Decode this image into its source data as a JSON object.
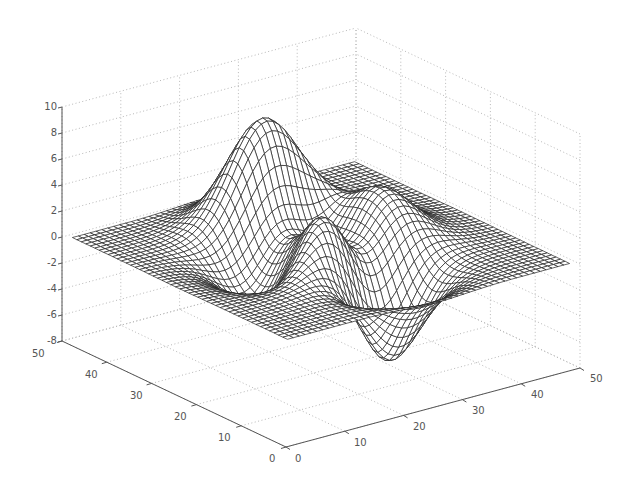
{
  "chart_data": {
    "type": "surface-mesh",
    "title": "",
    "function": "peaks",
    "grid_size": 49,
    "domain": [
      -3,
      3
    ],
    "x": {
      "label": "",
      "range": [
        0,
        50
      ],
      "ticks": [
        0,
        10,
        20,
        30,
        40,
        50
      ]
    },
    "y": {
      "label": "",
      "range": [
        0,
        50
      ],
      "ticks": [
        0,
        10,
        20,
        30,
        40,
        50
      ]
    },
    "z": {
      "label": "",
      "range": [
        -8,
        10
      ],
      "ticks": [
        -8,
        -6,
        -4,
        -2,
        0,
        2,
        4,
        6,
        8,
        10
      ]
    },
    "grid": true,
    "legend": null,
    "features": {
      "max_peak": {
        "z": 8.1,
        "note": "tall peak toward back-left"
      },
      "secondary_peak": {
        "z": 3.8,
        "note": "middle-front peak"
      },
      "trough": {
        "z": -6.55,
        "note": "deep trough front-right"
      },
      "flat_plane_z": 0
    },
    "colors": {
      "mesh_line": "#222222",
      "mesh_fill": "#ffffff",
      "grid": "#b8b8b8",
      "axis": "#555555"
    }
  },
  "labels": {
    "z_ticks": [
      "10",
      "8",
      "6",
      "4",
      "2",
      "0",
      "-2",
      "-4",
      "-6",
      "-8"
    ],
    "y_ticks": [
      "50",
      "40",
      "30",
      "20",
      "10",
      "0"
    ],
    "x_ticks": [
      "0",
      "10",
      "20",
      "30",
      "40",
      "50"
    ]
  }
}
